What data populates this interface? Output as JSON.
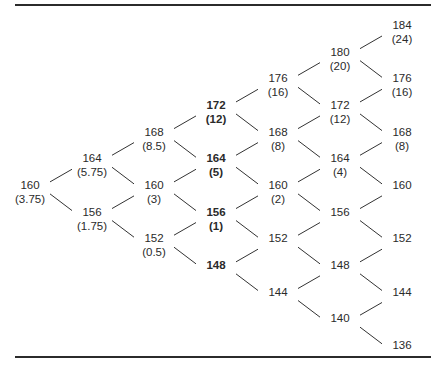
{
  "diagram": {
    "type": "binomial-tree",
    "columns": [
      [
        {
          "price": "160",
          "value": "(3.75)",
          "bold": false
        }
      ],
      [
        {
          "price": "164",
          "value": "(5.75)",
          "bold": false
        },
        {
          "price": "156",
          "value": "(1.75)",
          "bold": false
        }
      ],
      [
        {
          "price": "168",
          "value": "(8.5)",
          "bold": false
        },
        {
          "price": "160",
          "value": "(3)",
          "bold": false
        },
        {
          "price": "152",
          "value": "(0.5)",
          "bold": false
        }
      ],
      [
        {
          "price": "172",
          "value": "(12)",
          "bold": true
        },
        {
          "price": "164",
          "value": "(5)",
          "bold": true
        },
        {
          "price": "156",
          "value": "(1)",
          "bold": true
        },
        {
          "price": "148",
          "value": "",
          "bold": true
        }
      ],
      [
        {
          "price": "176",
          "value": "(16)",
          "bold": false
        },
        {
          "price": "168",
          "value": "(8)",
          "bold": false
        },
        {
          "price": "160",
          "value": "(2)",
          "bold": false
        },
        {
          "price": "152",
          "value": "",
          "bold": false
        },
        {
          "price": "144",
          "value": "",
          "bold": false
        }
      ],
      [
        {
          "price": "180",
          "value": "(20)",
          "bold": false
        },
        {
          "price": "172",
          "value": "(12)",
          "bold": false
        },
        {
          "price": "164",
          "value": "(4)",
          "bold": false
        },
        {
          "price": "156",
          "value": "",
          "bold": false
        },
        {
          "price": "148",
          "value": "",
          "bold": false
        },
        {
          "price": "140",
          "value": "",
          "bold": false
        }
      ],
      [
        {
          "price": "184",
          "value": "(24)",
          "bold": false
        },
        {
          "price": "176",
          "value": "(16)",
          "bold": false
        },
        {
          "price": "168",
          "value": "(8)",
          "bold": false
        },
        {
          "price": "160",
          "value": "",
          "bold": false
        },
        {
          "price": "152",
          "value": "",
          "bold": false
        },
        {
          "price": "144",
          "value": "",
          "bold": false
        },
        {
          "price": "136",
          "value": "",
          "bold": false
        }
      ]
    ]
  },
  "nodes": {
    "c0r0": {
      "price": "160",
      "value": "(3.75)"
    },
    "c1r0": {
      "price": "164",
      "value": "(5.75)"
    },
    "c1r1": {
      "price": "156",
      "value": "(1.75)"
    },
    "c2r0": {
      "price": "168",
      "value": "(8.5)"
    },
    "c2r1": {
      "price": "160",
      "value": "(3)"
    },
    "c2r2": {
      "price": "152",
      "value": "(0.5)"
    },
    "c3r0": {
      "price": "172",
      "value": "(12)"
    },
    "c3r1": {
      "price": "164",
      "value": "(5)"
    },
    "c3r2": {
      "price": "156",
      "value": "(1)"
    },
    "c3r3": {
      "price": "148",
      "value": ""
    },
    "c4r0": {
      "price": "176",
      "value": "(16)"
    },
    "c4r1": {
      "price": "168",
      "value": "(8)"
    },
    "c4r2": {
      "price": "160",
      "value": "(2)"
    },
    "c4r3": {
      "price": "152",
      "value": ""
    },
    "c4r4": {
      "price": "144",
      "value": ""
    },
    "c5r0": {
      "price": "180",
      "value": "(20)"
    },
    "c5r1": {
      "price": "172",
      "value": "(12)"
    },
    "c5r2": {
      "price": "164",
      "value": "(4)"
    },
    "c5r3": {
      "price": "156",
      "value": ""
    },
    "c5r4": {
      "price": "148",
      "value": ""
    },
    "c5r5": {
      "price": "140",
      "value": ""
    },
    "c6r0": {
      "price": "184",
      "value": "(24)"
    },
    "c6r1": {
      "price": "176",
      "value": "(16)"
    },
    "c6r2": {
      "price": "168",
      "value": "(8)"
    },
    "c6r3": {
      "price": "160",
      "value": ""
    },
    "c6r4": {
      "price": "152",
      "value": ""
    },
    "c6r5": {
      "price": "144",
      "value": ""
    },
    "c6r6": {
      "price": "136",
      "value": ""
    }
  },
  "colors": {
    "rule": "#2b2b2b",
    "line": "#333333",
    "text": "#2a2a2a"
  }
}
